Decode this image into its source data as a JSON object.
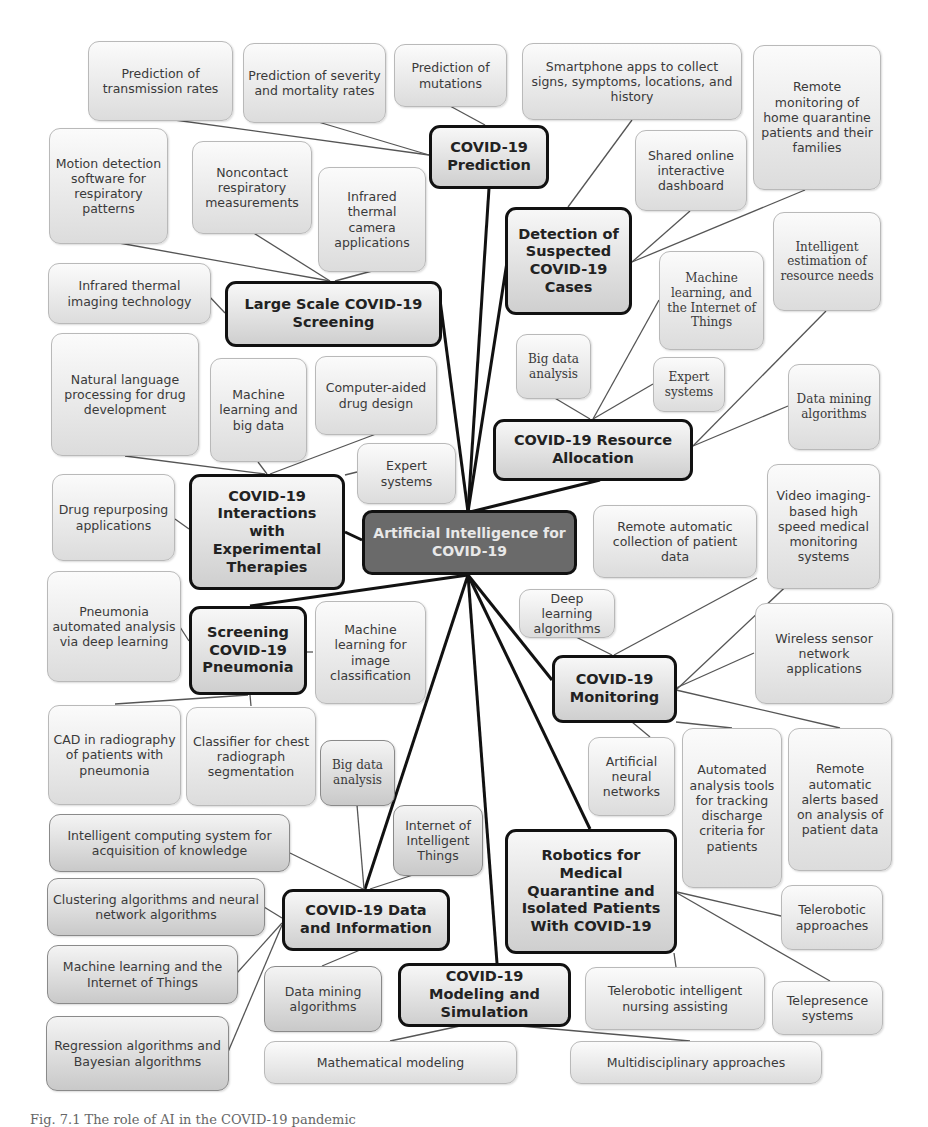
{
  "figure": {
    "center": "Artificial Intelligence for COVID-19",
    "colors": {
      "center_fill": "#6a6a6a",
      "center_text": "#e8e8e8",
      "hub_border": "#111111",
      "leaf_border": "#b9b9b9"
    },
    "hubs": {
      "prediction": {
        "label": "COVID-19 Prediction",
        "children": [
          "Prediction of transmission rates",
          "Prediction of severity and mortality rates",
          "Prediction of mutations"
        ]
      },
      "detection": {
        "label": "Detection of Suspected COVID-19 Cases",
        "children": [
          "Smartphone apps to collect signs, symptoms, locations, and history",
          "Shared online interactive dashboard",
          "Remote monitoring of home quarantine patients and their families"
        ]
      },
      "screening": {
        "label": "Large Scale COVID-19 Screening",
        "children": [
          "Motion detection software for respiratory patterns",
          "Noncontact respiratory measurements",
          "Infrared thermal camera applications",
          "Infrared thermal imaging technology"
        ]
      },
      "resource": {
        "label": "COVID-19 Resource Allocation",
        "children": [
          "Intelligent estimation of resource needs",
          "Machine learning, and the Internet of Things",
          "Big data analysis",
          "Expert systems",
          "Data mining algorithms"
        ]
      },
      "therapies": {
        "label": "COVID-19 Interactions with Experimental Therapies",
        "children": [
          "Natural language processing for drug development",
          "Machine learning and big data",
          "Computer-aided drug design",
          "Expert systems",
          "Drug repurposing applications"
        ]
      },
      "pneumonia": {
        "label": "Screening COVID-19 Pneumonia",
        "children": [
          "Pneumonia automated analysis via deep learning",
          "Machine learning for image classification",
          "CAD in radiography of patients with pneumonia",
          "Classifier for chest radiograph segmentation"
        ]
      },
      "monitoring": {
        "label": "COVID-19 Monitoring",
        "children": [
          "Remote automatic collection of patient data",
          "Video imaging-based high speed medical monitoring systems",
          "Deep learning algorithms",
          "Wireless sensor network applications",
          "Artificial neural networks",
          "Automated analysis tools for tracking discharge criteria for patients",
          "Remote automatic alerts based on analysis of patient data"
        ]
      },
      "robotics": {
        "label": "Robotics for Medical Quarantine and Isolated Patients With COVID-19",
        "children": [
          "Telerobotic approaches",
          "Telerobotic intelligent nursing assisting",
          "Telepresence systems"
        ]
      },
      "data": {
        "label": "COVID-19 Data and Information",
        "children": [
          "Big data analysis",
          "Internet of Intelligent Things",
          "Intelligent computing system for acquisition of knowledge",
          "Clustering algorithms and neural network algorithms",
          "Machine learning and the Internet of Things",
          "Regression algorithms and Bayesian algorithms",
          "Data mining algorithms"
        ]
      },
      "modeling": {
        "label": "COVID-19 Modeling and Simulation",
        "children": [
          "Mathematical modeling",
          "Multidisciplinary approaches"
        ]
      }
    },
    "caption": "Fig. 7.1   The role of AI in the COVID-19 pandemic"
  }
}
